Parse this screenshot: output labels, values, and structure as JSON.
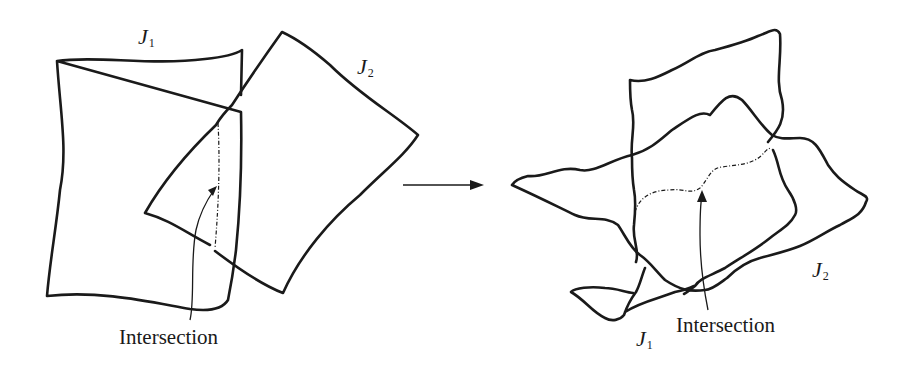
{
  "figure": {
    "left_panel": {
      "label_j1": {
        "base": "J",
        "sub": "1"
      },
      "label_j2": {
        "base": "J",
        "sub": "2"
      },
      "caption": "Intersection"
    },
    "arrow": {
      "direction": "right"
    },
    "right_panel": {
      "label_j1": {
        "base": "J",
        "sub": "1"
      },
      "label_j2": {
        "base": "J",
        "sub": "2"
      },
      "caption": "Intersection"
    }
  }
}
